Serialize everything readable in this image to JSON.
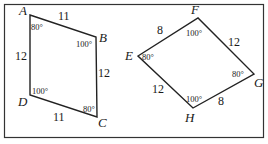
{
  "figure": {
    "frame_color": "#333333",
    "line_color": "#222222",
    "left": {
      "vertices": {
        "A": "A",
        "B": "B",
        "C": "C",
        "D": "D"
      },
      "sides": {
        "AB": "11",
        "BC": "12",
        "CD": "11",
        "DA": "12"
      },
      "angles": {
        "A": "80°",
        "B": "100°",
        "C": "80°",
        "D": "100°"
      }
    },
    "right": {
      "vertices": {
        "E": "E",
        "F": "F",
        "G": "G",
        "H": "H"
      },
      "sides": {
        "EF": "8",
        "FG": "12",
        "GH": "8",
        "HE": "12"
      },
      "angles": {
        "E": "80°",
        "F": "100°",
        "G": "80°",
        "H": "100°"
      }
    }
  }
}
